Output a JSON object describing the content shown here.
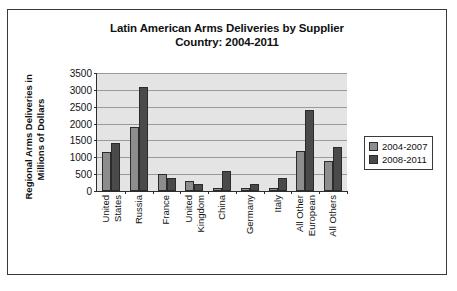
{
  "chart_data": {
    "type": "bar",
    "title": "Latin American Arms Deliveries by Supplier Country: 2004-2011",
    "title_line1": "Latin American Arms Deliveries by Supplier",
    "title_line2": "Country: 2004-2011",
    "xlabel": "",
    "ylabel": "Regional Arms Deliveries in Millions of Dollars",
    "ylabel_line1": "Regional Arms Deliveries in",
    "ylabel_line2": "Millions of Dollars",
    "ylim": [
      0,
      3500
    ],
    "ytick_step": 500,
    "yticks": [
      "3500",
      "3000",
      "2500",
      "2000",
      "1500",
      "1000",
      "500",
      "0"
    ],
    "ytick_values": [
      3500,
      3000,
      2500,
      2000,
      1500,
      1000,
      500,
      0
    ],
    "grid": true,
    "grid_axis": "y",
    "legend_position": "right",
    "plot_background": "#e4e4e4",
    "categories": [
      "United States",
      "Russia",
      "France",
      "United Kingdom",
      "China",
      "Germany",
      "Italy",
      "All Other European",
      "All Others"
    ],
    "category_lines": [
      [
        "United",
        "States"
      ],
      [
        "Russia"
      ],
      [
        "France"
      ],
      [
        "United",
        "Kingdom"
      ],
      [
        "China"
      ],
      [
        "Germany"
      ],
      [
        "Italy"
      ],
      [
        "All Other",
        "European"
      ],
      [
        "All Others"
      ]
    ],
    "series": [
      {
        "name": "2004-2007",
        "color": "#8d8d8d",
        "values": [
          1170,
          1900,
          500,
          300,
          100,
          100,
          100,
          1200,
          900
        ]
      },
      {
        "name": "2008-2011",
        "color": "#4a4a4a",
        "values": [
          1420,
          3100,
          400,
          200,
          600,
          200,
          400,
          2400,
          1300
        ]
      }
    ]
  },
  "legend": {
    "items": [
      {
        "label": "2004-2007",
        "color": "#8d8d8d"
      },
      {
        "label": "2008-2011",
        "color": "#4a4a4a"
      }
    ]
  }
}
